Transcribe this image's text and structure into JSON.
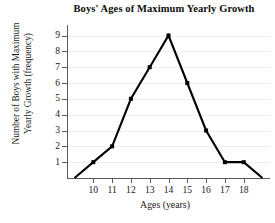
{
  "chart_data": {
    "type": "line",
    "title": "Boys' Ages of Maximum Yearly Growth",
    "xlabel": "Ages (years)",
    "ylabel_lines": [
      "Number of Boys with Maximum",
      "Yearly Growth (frequency)"
    ],
    "ylabel": "Number of Boys with Maximum Yearly Growth (frequency)",
    "x": [
      9,
      10,
      11,
      12,
      13,
      14,
      15,
      16,
      17,
      18,
      19
    ],
    "values": [
      0,
      1,
      2,
      5,
      7,
      9,
      6,
      3,
      1,
      1,
      0
    ],
    "xtick_labels": [
      "10",
      "11",
      "12",
      "13",
      "14",
      "15",
      "16",
      "17",
      "18"
    ],
    "xticks": [
      10,
      11,
      12,
      13,
      14,
      15,
      16,
      17,
      18
    ],
    "ytick_labels": [
      "1",
      "2",
      "3",
      "4",
      "5",
      "6",
      "7",
      "8",
      "9"
    ],
    "yticks": [
      1,
      2,
      3,
      4,
      5,
      6,
      7,
      8,
      9
    ],
    "xlim": [
      8.6,
      19.4
    ],
    "ylim": [
      0,
      9.6
    ],
    "grid": true,
    "legend": false,
    "line_color": "#000000",
    "marker": "square",
    "marker_color": "#000000",
    "grid_color": "#efefef",
    "axis_color": "#5a5a5a"
  }
}
